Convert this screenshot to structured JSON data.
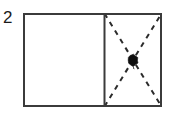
{
  "figure": {
    "label": "2",
    "label_name": "figure-number",
    "type": "geometry-diagram",
    "background_color": "#ffffff"
  },
  "diagram": {
    "outer_rectangle": {
      "name": "outer-rectangle",
      "x": 23,
      "y": 13,
      "width": 139,
      "height": 94,
      "stroke_color": "#3b3b3b",
      "stroke_width": 2,
      "fill": "none"
    },
    "divider": {
      "name": "vertical-divider",
      "x1": 104,
      "y1": 13,
      "x2": 104,
      "y2": 107,
      "stroke_color": "#3b3b3b",
      "stroke_width": 2,
      "style": "solid"
    },
    "left_cell": {
      "name": "left-cell",
      "x": 23,
      "y": 13,
      "width": 81,
      "height": 94,
      "fill": "#ffffff",
      "contents": "empty"
    },
    "right_cell": {
      "name": "right-cell",
      "x": 104,
      "y": 13,
      "width": 58,
      "height": 94,
      "fill": "#ffffff",
      "contents": "dashed-diagonals-with-dot"
    },
    "diagonals": [
      {
        "name": "diagonal-top-left-to-bottom-right",
        "x1": 104,
        "y1": 13,
        "x2": 162,
        "y2": 107,
        "stroke_color": "#2b2b2b",
        "stroke_width": 2,
        "style": "dashed",
        "dash_pattern": "5 5"
      },
      {
        "name": "diagonal-bottom-left-to-top-right",
        "x1": 104,
        "y1": 107,
        "x2": 162,
        "y2": 13,
        "stroke_color": "#2b2b2b",
        "stroke_width": 2,
        "style": "dashed",
        "dash_pattern": "5 5"
      }
    ],
    "marker_dot": {
      "name": "center-dot-marker",
      "cx": 133,
      "cy": 60,
      "rx": 5,
      "ry": 5.5,
      "fill_color": "#111111",
      "shape": "irregular-blob"
    }
  }
}
